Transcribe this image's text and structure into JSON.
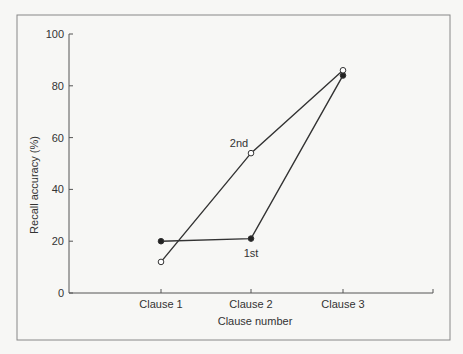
{
  "chart_data": {
    "type": "line",
    "title": "",
    "xlabel": "Clause number",
    "ylabel": "Recall accuracy (%)",
    "categories": [
      "Clause 1",
      "Clause 2",
      "Clause 3"
    ],
    "ylim": [
      0,
      100
    ],
    "yticks": [
      0,
      20,
      40,
      60,
      80,
      100
    ],
    "grid": false,
    "legend": "none (series labelled inline)",
    "series": [
      {
        "name": "1st",
        "marker": "filled-circle",
        "values": [
          20,
          21,
          84
        ]
      },
      {
        "name": "2nd",
        "marker": "open-circle",
        "values": [
          12,
          54,
          86
        ]
      }
    ],
    "annotations": [
      {
        "text": "1st",
        "near": "Clause 2"
      },
      {
        "text": "2nd",
        "near": "Clause 2"
      }
    ]
  },
  "colors": {
    "line": "#333333",
    "frame": "#777777",
    "background": "#f7f7f5"
  }
}
